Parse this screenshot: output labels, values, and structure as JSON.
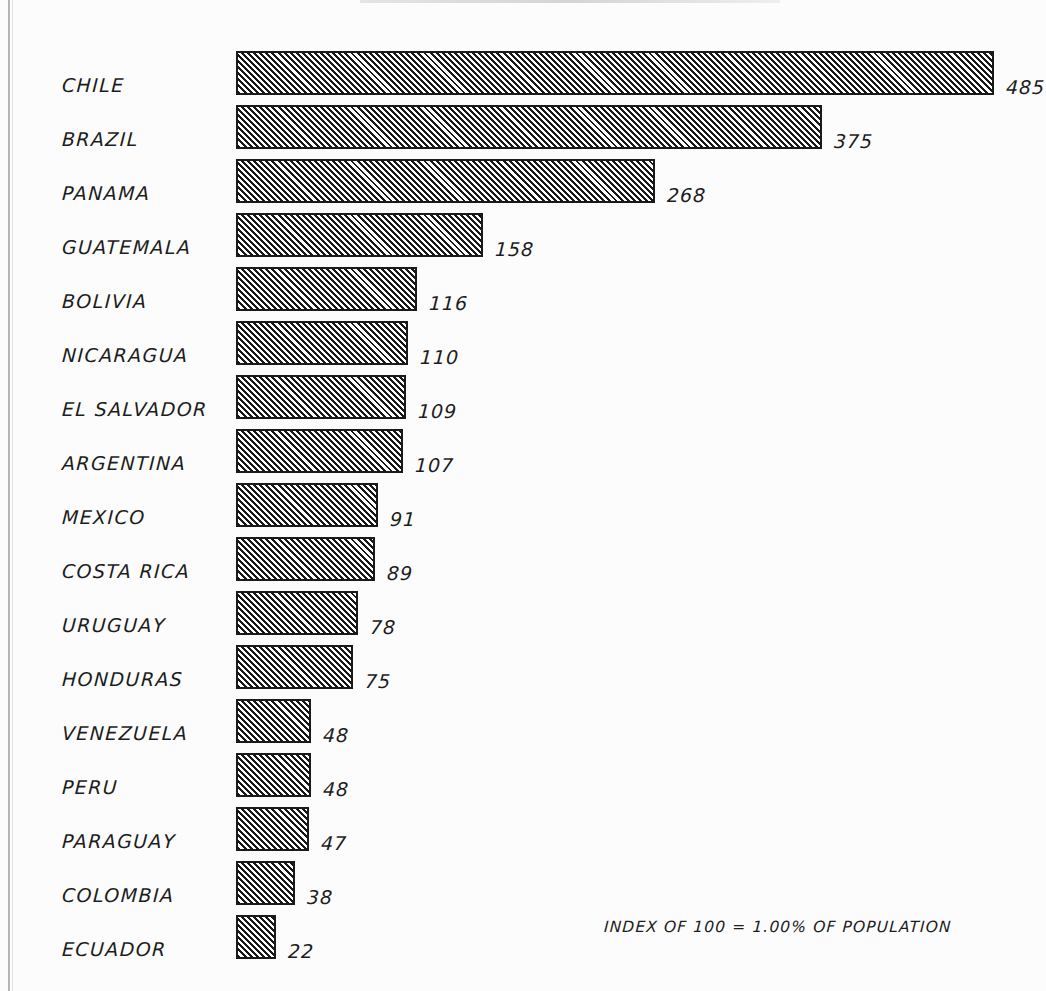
{
  "chart_data": {
    "type": "bar",
    "orientation": "horizontal",
    "title": "",
    "xlabel": "",
    "ylabel": "",
    "grid": false,
    "legend": null,
    "xlim": [
      0,
      485
    ],
    "note": "INDEX OF 100 = 1.00% OF POPULATION",
    "categories": [
      "CHILE",
      "BRAZIL",
      "PANAMA",
      "GUATEMALA",
      "BOLIVIA",
      "NICARAGUA",
      "EL SALVADOR",
      "ARGENTINA",
      "MEXICO",
      "COSTA RICA",
      "URUGUAY",
      "HONDURAS",
      "VENEZUELA",
      "PERU",
      "PARAGUAY",
      "COLOMBIA",
      "ECUADOR"
    ],
    "values": [
      485,
      375,
      268,
      158,
      116,
      110,
      109,
      107,
      91,
      89,
      78,
      75,
      48,
      48,
      47,
      38,
      22
    ],
    "bars": [
      {
        "category": "CHILE",
        "value": 485,
        "label": "485"
      },
      {
        "category": "BRAZIL",
        "value": 375,
        "label": "375"
      },
      {
        "category": "PANAMA",
        "value": 268,
        "label": "268"
      },
      {
        "category": "GUATEMALA",
        "value": 158,
        "label": "158"
      },
      {
        "category": "BOLIVIA",
        "value": 116,
        "label": "116"
      },
      {
        "category": "NICARAGUA",
        "value": 110,
        "label": "110"
      },
      {
        "category": "EL SALVADOR",
        "value": 109,
        "label": "109"
      },
      {
        "category": "ARGENTINA",
        "value": 107,
        "label": "107"
      },
      {
        "category": "MEXICO",
        "value": 91,
        "label": "91"
      },
      {
        "category": "COSTA RICA",
        "value": 89,
        "label": "89"
      },
      {
        "category": "URUGUAY",
        "value": 78,
        "label": "78"
      },
      {
        "category": "HONDURAS",
        "value": 75,
        "label": "75"
      },
      {
        "category": "VENEZUELA",
        "value": 48,
        "label": "48"
      },
      {
        "category": "PERU",
        "value": 48,
        "label": "48"
      },
      {
        "category": "PARAGUAY",
        "value": 47,
        "label": "47"
      },
      {
        "category": "COLOMBIA",
        "value": 38,
        "label": "38"
      },
      {
        "category": "ECUADOR",
        "value": 22,
        "label": "22"
      }
    ]
  },
  "layout": {
    "bar_origin_x": 236,
    "px_per_unit": 1.5625,
    "row_pitch": 54,
    "first_row_top": 50,
    "bar_height": 44,
    "value_gap": 12,
    "min_bar_width": 40
  },
  "colors": {
    "ink": "#1d1d1d",
    "hatch": "#181818",
    "paper": "#fcfcfc",
    "page_edge": "#9a9a9a"
  },
  "footnote": "INDEX OF 100 = 1.00% OF POPULATION"
}
